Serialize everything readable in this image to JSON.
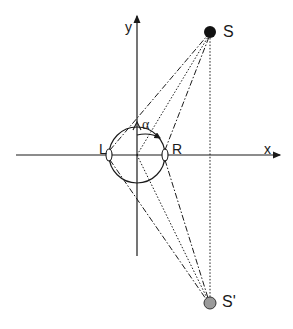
{
  "diagram": {
    "type": "geometry-schematic",
    "axes": {
      "x_label": "x",
      "y_label": "y"
    },
    "labels": {
      "left_ear": "L",
      "right_ear": "R",
      "source": "S",
      "image_source": "S'",
      "angle": "α"
    },
    "colors": {
      "line": "#1a1a1a",
      "source_fill": "#111111",
      "image_source_fill": "#9a9a9a",
      "background": "#ffffff"
    },
    "elements": [
      {
        "name": "head",
        "shape": "circle",
        "center": [
          137,
          155
        ],
        "radius": 28
      },
      {
        "name": "nose",
        "shape": "triangle",
        "tip": [
          137,
          127
        ]
      },
      {
        "name": "left-ear",
        "position": [
          109,
          155
        ]
      },
      {
        "name": "right-ear",
        "position": [
          165,
          155
        ]
      },
      {
        "name": "source-S",
        "position": [
          210,
          32
        ],
        "fill": "black"
      },
      {
        "name": "image-source-S-prime",
        "position": [
          210,
          303
        ],
        "fill": "gray"
      }
    ],
    "line_styles": {
      "ear_to_source": "dash-dot",
      "center_to_source": "dotted",
      "vertical_S_to_S_prime": "dotted"
    }
  }
}
